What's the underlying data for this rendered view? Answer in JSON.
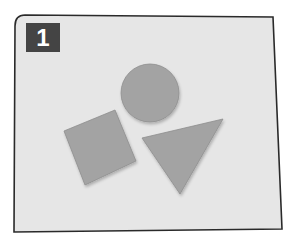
{
  "figure": {
    "label": "1",
    "colors": {
      "page_bg": "#ffffff",
      "card_bg": "#e6e6e6",
      "card_border": "#2a2a2a",
      "badge_bg": "#444444",
      "badge_text": "#ffffff",
      "shape_fill": "#a3a3a3",
      "shape_edge": "#8e8e8e"
    },
    "shapes": [
      {
        "type": "circle",
        "name": "circle"
      },
      {
        "type": "square",
        "name": "square"
      },
      {
        "type": "triangle",
        "name": "triangle"
      }
    ]
  }
}
